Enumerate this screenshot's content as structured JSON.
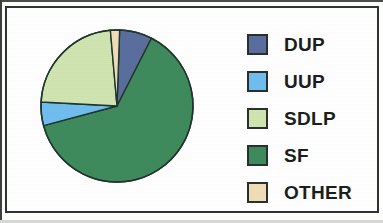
{
  "chart_data": {
    "type": "pie",
    "title": "",
    "subtitle": "",
    "xlabel": "",
    "ylabel": "",
    "legend_position": "right",
    "grid": false,
    "categories": [
      "DUP",
      "UUP",
      "SDLP",
      "SF",
      "OTHER"
    ],
    "values": [
      7,
      5,
      23,
      63,
      2
    ],
    "units": "percent",
    "start_angle_deg": 0,
    "direction": "clockwise",
    "slices": [
      {
        "label": "DUP",
        "value": 7,
        "color": "#5a6e9e",
        "start_deg": 2,
        "end_deg": 27
      },
      {
        "label": "SF",
        "value": 63,
        "color": "#3f8a5c",
        "start_deg": 27,
        "end_deg": 255
      },
      {
        "label": "UUP",
        "value": 5,
        "color": "#70bdee",
        "start_deg": 255,
        "end_deg": 273
      },
      {
        "label": "SDLP",
        "value": 23,
        "color": "#cfe4b0",
        "start_deg": 273,
        "end_deg": 355
      },
      {
        "label": "OTHER",
        "value": 2,
        "color": "#f0ddb8",
        "start_deg": 355,
        "end_deg": 362
      }
    ]
  },
  "legend": {
    "items": [
      {
        "label": "DUP",
        "color": "#5a6e9e"
      },
      {
        "label": "UUP",
        "color": "#70bdee"
      },
      {
        "label": "SDLP",
        "color": "#cfe4b0"
      },
      {
        "label": "SF",
        "color": "#3f8a5c"
      },
      {
        "label": "OTHER",
        "color": "#f0ddb8"
      }
    ]
  },
  "style": {
    "frame_color": "#2e3330",
    "background": "#ffffff",
    "slice_outline": "#20352c"
  }
}
